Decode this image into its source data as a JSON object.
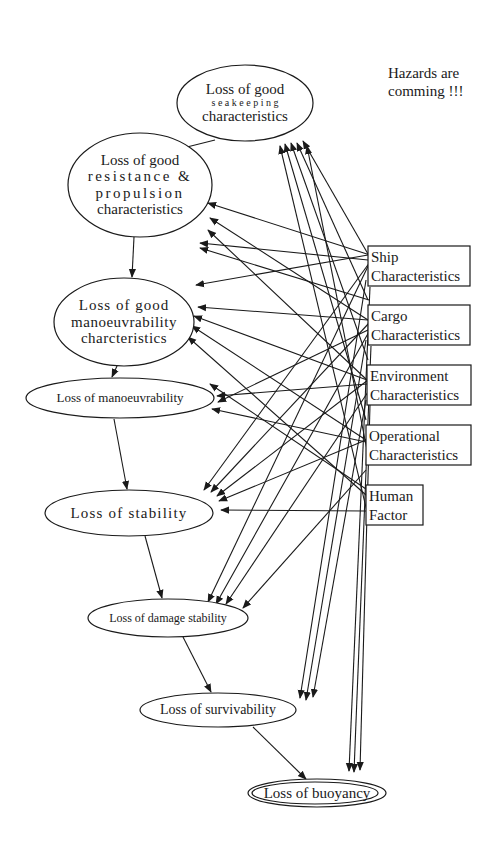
{
  "note": {
    "lines": [
      "Hazards are",
      "comming !!!"
    ],
    "x": 388,
    "y": 78
  },
  "colors": {
    "stroke": "#1a1a1a",
    "background": "#ffffff"
  },
  "hazard_nodes": [
    {
      "id": "seakeeping",
      "shape": "ellipse",
      "cx": 245,
      "cy": 103,
      "rx": 68,
      "ry": 38,
      "lines": [
        "Loss of good",
        "s e a k e e p i n g",
        "characteristics"
      ],
      "sizes": [
        15,
        10,
        15
      ]
    },
    {
      "id": "resistance",
      "shape": "ellipse",
      "cx": 140,
      "cy": 185,
      "rx": 72,
      "ry": 52,
      "lines": [
        "Loss of good",
        "resistance &",
        "propulsion",
        "characteristics"
      ],
      "sizes": [
        15,
        15,
        15,
        15
      ],
      "spacing": [
        0,
        2.5,
        2.5,
        0
      ]
    },
    {
      "id": "manoeuvrability_chars",
      "shape": "ellipse",
      "cx": 124,
      "cy": 322,
      "rx": 70,
      "ry": 44,
      "lines": [
        "Loss of good",
        "manoeuvrability",
        "charcteristics"
      ],
      "sizes": [
        15,
        15,
        15
      ],
      "spacing": [
        1,
        0.5,
        0.5
      ]
    },
    {
      "id": "manoeuvrability",
      "shape": "ellipse",
      "cx": 120,
      "cy": 398,
      "rx": 94,
      "ry": 20,
      "lines": [
        "Loss of manoeuvrability"
      ],
      "sizes": [
        13
      ]
    },
    {
      "id": "stability",
      "shape": "ellipse",
      "cx": 129,
      "cy": 513,
      "rx": 84,
      "ry": 23,
      "lines": [
        "Loss of stability"
      ],
      "sizes": [
        15
      ],
      "spacing": [
        1.2
      ]
    },
    {
      "id": "damage_stability",
      "shape": "ellipse",
      "cx": 168,
      "cy": 618,
      "rx": 80,
      "ry": 19,
      "lines": [
        "Loss of damage stability"
      ],
      "sizes": [
        12
      ]
    },
    {
      "id": "survivability",
      "shape": "ellipse",
      "cx": 218,
      "cy": 710,
      "rx": 78,
      "ry": 17,
      "lines": [
        "Loss of survivability"
      ],
      "sizes": [
        14
      ]
    },
    {
      "id": "buoyancy",
      "shape": "double-ellipse",
      "cx": 317,
      "cy": 793,
      "rx": 69,
      "ry": 14,
      "lines": [
        "Loss of buoyancy"
      ],
      "sizes": [
        15
      ]
    }
  ],
  "factor_nodes": [
    {
      "id": "ship",
      "x": 368,
      "y": 246,
      "w": 102,
      "h": 40,
      "lines": [
        "Ship",
        "Characteristics"
      ]
    },
    {
      "id": "cargo",
      "x": 368,
      "y": 305,
      "w": 102,
      "h": 40,
      "lines": [
        "Cargo",
        "Characteristics"
      ]
    },
    {
      "id": "environment",
      "x": 367,
      "y": 365,
      "w": 104,
      "h": 40,
      "lines": [
        "Environment",
        "Characteristics"
      ]
    },
    {
      "id": "operational",
      "x": 366,
      "y": 425,
      "w": 105,
      "h": 40,
      "lines": [
        "Operational",
        "Characteristics"
      ]
    },
    {
      "id": "human",
      "x": 366,
      "y": 485,
      "w": 57,
      "h": 40,
      "lines": [
        "Human",
        "Factor"
      ]
    }
  ],
  "chain_edges": [
    {
      "from": [
        215,
        140
      ],
      "to": [
        135,
        160
      ]
    },
    {
      "from": [
        134,
        237
      ],
      "to": [
        132,
        277
      ]
    },
    {
      "from": [
        117,
        366
      ],
      "to": [
        112,
        377
      ]
    },
    {
      "from": [
        114,
        419
      ],
      "to": [
        127,
        489
      ]
    },
    {
      "from": [
        145,
        536
      ],
      "to": [
        162,
        598
      ]
    },
    {
      "from": [
        183,
        637
      ],
      "to": [
        211,
        692
      ]
    },
    {
      "from": [
        253,
        727
      ],
      "to": [
        306,
        779
      ]
    }
  ],
  "factor_edges": [
    {
      "from": [
        368,
        254
      ],
      "to": [
        303,
        141
      ]
    },
    {
      "from": [
        368,
        300
      ],
      "to": [
        297,
        143
      ]
    },
    {
      "from": [
        368,
        360
      ],
      "to": [
        291,
        143
      ]
    },
    {
      "from": [
        366,
        420
      ],
      "to": [
        285,
        144
      ]
    },
    {
      "from": [
        370,
        255
      ],
      "to": [
        208,
        203
      ]
    },
    {
      "from": [
        368,
        320
      ],
      "to": [
        210,
        218
      ]
    },
    {
      "from": [
        367,
        380
      ],
      "to": [
        208,
        230
      ]
    },
    {
      "from": [
        368,
        260
      ],
      "to": [
        200,
        243
      ]
    },
    {
      "from": [
        368,
        255
      ],
      "to": [
        196,
        285
      ]
    },
    {
      "from": [
        368,
        320
      ],
      "to": [
        198,
        307
      ]
    },
    {
      "from": [
        367,
        380
      ],
      "to": [
        194,
        316
      ]
    },
    {
      "from": [
        366,
        440
      ],
      "to": [
        192,
        326
      ]
    },
    {
      "from": [
        366,
        495
      ],
      "to": [
        188,
        337
      ]
    },
    {
      "from": [
        367,
        384
      ],
      "to": [
        217,
        396
      ]
    },
    {
      "from": [
        368,
        330
      ],
      "to": [
        218,
        402
      ]
    },
    {
      "from": [
        366,
        442
      ],
      "to": [
        212,
        409
      ]
    },
    {
      "from": [
        370,
        262
      ],
      "to": [
        204,
        490
      ]
    },
    {
      "from": [
        370,
        322
      ],
      "to": [
        211,
        492
      ]
    },
    {
      "from": [
        368,
        380
      ],
      "to": [
        217,
        496
      ]
    },
    {
      "from": [
        366,
        440
      ],
      "to": [
        219,
        501
      ]
    },
    {
      "from": [
        366,
        511
      ],
      "to": [
        221,
        510
      ]
    },
    {
      "from": [
        370,
        262
      ],
      "to": [
        208,
        602
      ]
    },
    {
      "from": [
        370,
        330
      ],
      "to": [
        216,
        604
      ]
    },
    {
      "from": [
        368,
        392
      ],
      "to": [
        226,
        604
      ]
    },
    {
      "from": [
        366,
        470
      ],
      "to": [
        243,
        608
      ]
    },
    {
      "from": [
        366,
        280
      ],
      "to": [
        300,
        698
      ]
    },
    {
      "from": [
        366,
        340
      ],
      "to": [
        306,
        700
      ]
    },
    {
      "from": [
        366,
        400
      ],
      "to": [
        313,
        697
      ]
    },
    {
      "from": [
        370,
        287
      ],
      "to": [
        349,
        771
      ]
    },
    {
      "from": [
        371,
        346
      ],
      "to": [
        354,
        772
      ]
    },
    {
      "from": [
        370,
        405
      ],
      "to": [
        360,
        770
      ]
    }
  ],
  "reverse_edges": [
    {
      "from": [
        369,
        460
      ],
      "to": [
        307,
        146
      ]
    },
    {
      "from": [
        369,
        520
      ],
      "to": [
        280,
        146
      ]
    },
    {
      "from": [
        369,
        300
      ],
      "to": [
        200,
        248
      ]
    },
    {
      "from": [
        366,
        489
      ],
      "to": [
        210,
        384
      ]
    }
  ]
}
